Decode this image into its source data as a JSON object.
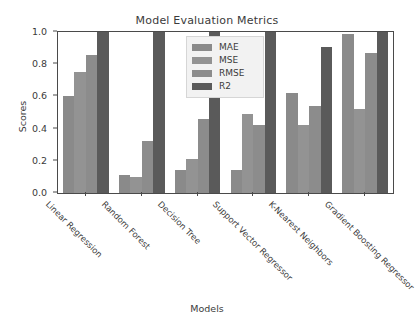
{
  "chart_data": {
    "type": "bar",
    "title": "Model Evaluation Metrics",
    "xlabel": "Models",
    "ylabel": "Scores",
    "ylim": [
      0.0,
      1.0
    ],
    "yticks": [
      "0.0",
      "0.2",
      "0.4",
      "0.6",
      "0.8",
      "1.0"
    ],
    "grid": false,
    "legend_position": "upper center",
    "categories": [
      "Linear Regression",
      "Random Forest",
      "Decision Tree",
      "Support Vector Regressor",
      "K-Nearest Neighbors",
      "Gradient Boosting Regressor"
    ],
    "series": [
      {
        "name": "MAE",
        "color": "#8a8a8a",
        "values": [
          0.6,
          0.11,
          0.14,
          0.14,
          0.62,
          0.99
        ]
      },
      {
        "name": "MSE",
        "color": "#939393",
        "values": [
          0.75,
          0.1,
          0.21,
          0.49,
          0.42,
          0.52
        ]
      },
      {
        "name": "RMSE",
        "color": "#8c8c8c",
        "values": [
          0.86,
          0.32,
          0.46,
          0.42,
          0.54,
          0.87
        ]
      },
      {
        "name": "R2",
        "color": "#5a5a5a",
        "values": [
          1.0,
          1.0,
          1.0,
          1.0,
          0.91,
          1.0
        ]
      }
    ]
  },
  "colors": {
    "axis": "#4a4a4a",
    "text": "#3b3b3b",
    "background": "#ffffff",
    "legend_background": "#f2f2f2"
  }
}
